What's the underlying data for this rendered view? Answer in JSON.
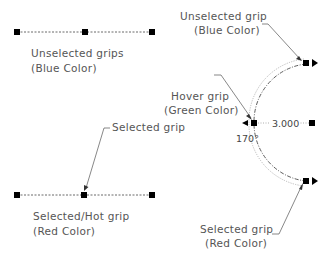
{
  "diagram": {
    "unselected_line": {
      "label_line1": "Unselected grips",
      "label_line2": "(Blue Color)",
      "grip_count": 3
    },
    "selected_line": {
      "callout": "Selected grip",
      "label_line1": "Selected/Hot grip",
      "label_line2": "(Red Color)",
      "grip_count": 3
    },
    "arc": {
      "top_callout_line1": "Unselected grip",
      "top_callout_line2": "(Blue Color)",
      "hover_callout_line1": "Hover grip",
      "hover_callout_line2": "(Green Color)",
      "bottom_callout_line1": "Selected grip",
      "bottom_callout_line2": "(Red Color)",
      "radius_dimension": "3.000",
      "angle_dimension": "170°"
    },
    "colors": {
      "grip": "#000000",
      "line": "#333333",
      "text": "#555555",
      "ghost_arc": "#aaaaaa"
    }
  }
}
